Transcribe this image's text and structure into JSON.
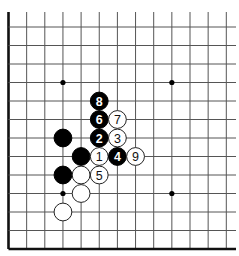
{
  "diagram": {
    "type": "go-board-fragment",
    "visible_columns": 13,
    "visible_rows": 13,
    "edges": [
      "left",
      "bottom"
    ],
    "colors": {
      "background": "#ffffff",
      "line": "#555555",
      "black_stone": "#000000",
      "white_stone": "#ffffff"
    },
    "star_points": [
      {
        "col": 3,
        "row": 3
      },
      {
        "col": 9,
        "row": 3
      },
      {
        "col": 3,
        "row": 9
      },
      {
        "col": 9,
        "row": 9
      }
    ],
    "stones": [
      {
        "color": "black",
        "col": 3,
        "row": 6,
        "label": ""
      },
      {
        "color": "black",
        "col": 4,
        "row": 7,
        "label": ""
      },
      {
        "color": "black",
        "col": 3,
        "row": 8,
        "label": ""
      },
      {
        "color": "white",
        "col": 4,
        "row": 8,
        "label": ""
      },
      {
        "color": "white",
        "col": 4,
        "row": 9,
        "label": ""
      },
      {
        "color": "white",
        "col": 3,
        "row": 10,
        "label": ""
      },
      {
        "color": "white",
        "col": 5,
        "row": 7,
        "label": "1"
      },
      {
        "color": "black",
        "col": 5,
        "row": 6,
        "label": "2"
      },
      {
        "color": "white",
        "col": 6,
        "row": 6,
        "label": "3"
      },
      {
        "color": "black",
        "col": 6,
        "row": 7,
        "label": "4"
      },
      {
        "color": "white",
        "col": 5,
        "row": 8,
        "label": "5"
      },
      {
        "color": "black",
        "col": 5,
        "row": 5,
        "label": "6"
      },
      {
        "color": "white",
        "col": 6,
        "row": 5,
        "label": "7"
      },
      {
        "color": "black",
        "col": 5,
        "row": 4,
        "label": "8"
      },
      {
        "color": "white",
        "col": 7,
        "row": 7,
        "label": "9"
      }
    ]
  }
}
